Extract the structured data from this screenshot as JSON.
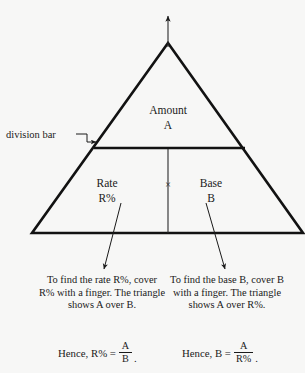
{
  "figure": {
    "kind": "percent-triangle-diagram",
    "background_color": "#f7f7f6",
    "ink_color": "#1a1a1a"
  },
  "triangle": {
    "amount_label": "Amount",
    "amount_symbol": "A",
    "rate_label": "Rate",
    "rate_symbol": "R%",
    "base_label": "Base",
    "base_symbol": "B",
    "operator": "×",
    "division_bar_callout": "division bar"
  },
  "instructions": [
    {
      "id": "rate",
      "text": "To find the rate R%, cover R% with a finger. The triangle shows A over B."
    },
    {
      "id": "base",
      "text": "To find the base B, cover B with a finger. The triangle shows A over R%."
    }
  ],
  "conclusions": [
    {
      "id": "rate",
      "lead": "Hence, R% =",
      "numerator": "A",
      "denominator": "B",
      "tail": "."
    },
    {
      "id": "base",
      "lead": "Hence, B =",
      "numerator": "A",
      "denominator": "R%",
      "tail": "."
    }
  ]
}
